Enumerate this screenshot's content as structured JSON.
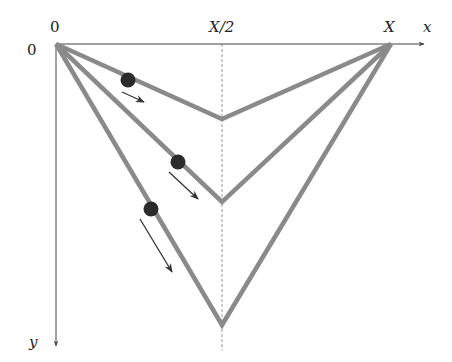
{
  "figure": {
    "title": "",
    "axes": {
      "x_label": "x",
      "y_label": "y",
      "origin_x_label": "0",
      "origin_y_label": "0",
      "mid_label": "X/2",
      "end_label": "X"
    },
    "paths": [
      {
        "name": "shallow",
        "vertex_depth": "small",
        "has_ball": true,
        "arrow_length": "short"
      },
      {
        "name": "medium",
        "vertex_depth": "medium",
        "has_ball": true,
        "arrow_length": "medium"
      },
      {
        "name": "steep",
        "vertex_depth": "large",
        "has_ball": true,
        "arrow_length": "long"
      }
    ],
    "colors": {
      "path": "#8a8a8a",
      "axis": "#444444",
      "ball": "#2b2b2b",
      "arrow": "#333333",
      "dashed": "#999999"
    }
  }
}
